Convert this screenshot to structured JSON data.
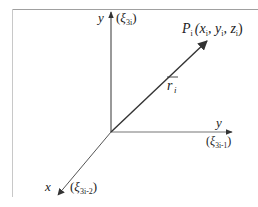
{
  "diagram": {
    "type": "3d-coordinate-system",
    "frame_color": "#9a9a9a",
    "axis_color": "#555555",
    "vector_color": "#333333",
    "axes": {
      "vertical": {
        "name": "y",
        "alias_symbol": "ξ",
        "alias_subscript": "3i"
      },
      "horizontal": {
        "name": "y",
        "alias_symbol": "ξ",
        "alias_subscript": "3i-1"
      },
      "diagonal": {
        "name": "x",
        "alias_symbol": "ξ",
        "alias_subscript": "3i-2"
      }
    },
    "point": {
      "name": "P",
      "subscript": "i",
      "coords_text": "(x",
      "coord_sub": "i",
      "coords_parts": [
        "(x",
        "i",
        ", y",
        "i",
        ", z",
        "i",
        ")"
      ]
    },
    "vector": {
      "name": "r",
      "subscript": "i",
      "overline": true
    }
  }
}
